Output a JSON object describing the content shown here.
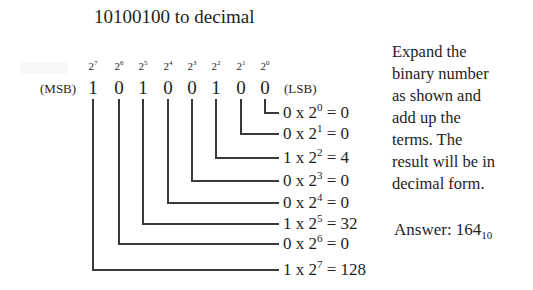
{
  "title": "10100100 to decimal",
  "binary": "10100100",
  "labels": {
    "msb": "(MSB)",
    "lsb": "(LSB)"
  },
  "columns": [
    {
      "power": "7",
      "bit": "1",
      "x": 93
    },
    {
      "power": "6",
      "bit": "0",
      "x": 119
    },
    {
      "power": "5",
      "bit": "1",
      "x": 143
    },
    {
      "power": "4",
      "bit": "0",
      "x": 168
    },
    {
      "power": "3",
      "bit": "0",
      "x": 192
    },
    {
      "power": "2",
      "bit": "1",
      "x": 216
    },
    {
      "power": "1",
      "bit": "0",
      "x": 241
    },
    {
      "power": "0",
      "bit": "0",
      "x": 265
    }
  ],
  "terms": [
    {
      "bit": "0",
      "exp": "0",
      "result": "0",
      "y": 112
    },
    {
      "bit": "0",
      "exp": "1",
      "result": "0",
      "y": 133
    },
    {
      "bit": "1",
      "exp": "2",
      "result": "4",
      "y": 157
    },
    {
      "bit": "0",
      "exp": "3",
      "result": "0",
      "y": 180
    },
    {
      "bit": "0",
      "exp": "4",
      "result": "0",
      "y": 202
    },
    {
      "bit": "1",
      "exp": "5",
      "result": "32",
      "y": 223
    },
    {
      "bit": "0",
      "exp": "6",
      "result": "0",
      "y": 243
    },
    {
      "bit": "1",
      "exp": "7",
      "result": "128",
      "y": 269
    }
  ],
  "description": {
    "lines": [
      "Expand the",
      "binary number",
      "as shown and",
      "add up the",
      "terms. The",
      "result will be in",
      "decimal form."
    ]
  },
  "answer": {
    "label": "Answer:",
    "value": "164",
    "base": "10"
  },
  "colors": {
    "ink": "#1e1e1e",
    "line": "#3a3a3a",
    "background": "#ffffff"
  }
}
